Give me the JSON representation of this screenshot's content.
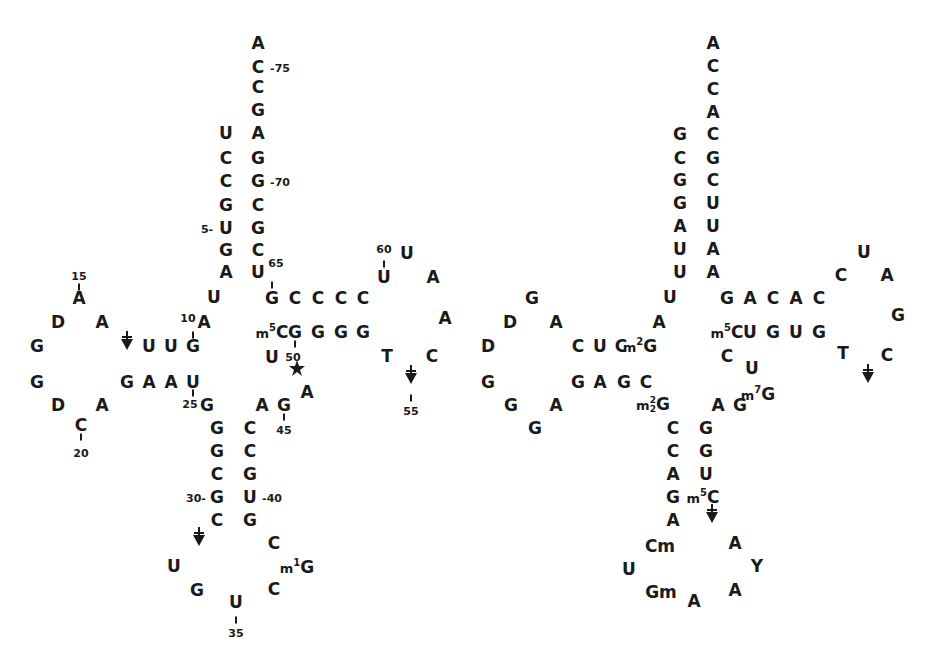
{
  "diagram": {
    "type": "tRNA cloverleaf secondary structures",
    "structures": [
      {
        "id": "left",
        "nucleotides": [
          {
            "t": "A",
            "x": 258,
            "y": 43
          },
          {
            "t": "C",
            "x": 258,
            "y": 67
          },
          {
            "t": "C",
            "x": 258,
            "y": 87
          },
          {
            "t": "G",
            "x": 258,
            "y": 110
          },
          {
            "t": "A",
            "x": 258,
            "y": 133
          },
          {
            "t": "G",
            "x": 258,
            "y": 158
          },
          {
            "t": "G",
            "x": 258,
            "y": 181
          },
          {
            "t": "C",
            "x": 258,
            "y": 205
          },
          {
            "t": "G",
            "x": 258,
            "y": 228
          },
          {
            "t": "C",
            "x": 258,
            "y": 250
          },
          {
            "t": "U",
            "x": 258,
            "y": 272
          },
          {
            "t": "U",
            "x": 226,
            "y": 133
          },
          {
            "t": "C",
            "x": 226,
            "y": 158
          },
          {
            "t": "C",
            "x": 226,
            "y": 181
          },
          {
            "t": "G",
            "x": 226,
            "y": 205
          },
          {
            "t": "U",
            "x": 226,
            "y": 228
          },
          {
            "t": "G",
            "x": 226,
            "y": 250
          },
          {
            "t": "A",
            "x": 226,
            "y": 272
          },
          {
            "t": "U",
            "x": 214,
            "y": 297
          },
          {
            "t": "A",
            "x": 204,
            "y": 322
          },
          {
            "t": "G",
            "x": 193,
            "y": 346
          },
          {
            "t": "U",
            "x": 171,
            "y": 346
          },
          {
            "t": "U",
            "x": 149,
            "y": 346
          },
          {
            "t": "A",
            "x": 79,
            "y": 298
          },
          {
            "t": "D",
            "x": 58,
            "y": 322
          },
          {
            "t": "A",
            "x": 102,
            "y": 322
          },
          {
            "t": "G",
            "x": 37,
            "y": 346
          },
          {
            "t": "G",
            "x": 37,
            "y": 382
          },
          {
            "t": "D",
            "x": 58,
            "y": 405
          },
          {
            "t": "A",
            "x": 102,
            "y": 405
          },
          {
            "t": "C",
            "x": 81,
            "y": 425
          },
          {
            "t": "G",
            "x": 127,
            "y": 382
          },
          {
            "t": "A",
            "x": 149,
            "y": 382
          },
          {
            "t": "A",
            "x": 171,
            "y": 382
          },
          {
            "t": "U",
            "x": 193,
            "y": 382
          },
          {
            "t": "G",
            "x": 207,
            "y": 405
          },
          {
            "t": "G",
            "x": 217,
            "y": 428
          },
          {
            "t": "G",
            "x": 217,
            "y": 451
          },
          {
            "t": "C",
            "x": 217,
            "y": 474
          },
          {
            "t": "G",
            "x": 217,
            "y": 497
          },
          {
            "t": "C",
            "x": 217,
            "y": 520
          },
          {
            "t": "C",
            "x": 250,
            "y": 428
          },
          {
            "t": "C",
            "x": 250,
            "y": 451
          },
          {
            "t": "G",
            "x": 250,
            "y": 474
          },
          {
            "t": "U",
            "x": 250,
            "y": 497
          },
          {
            "t": "G",
            "x": 250,
            "y": 520
          },
          {
            "t": "U",
            "x": 174,
            "y": 566
          },
          {
            "t": "G",
            "x": 197,
            "y": 590
          },
          {
            "t": "U",
            "x": 236,
            "y": 602
          },
          {
            "t": "C",
            "x": 274,
            "y": 589
          },
          {
            "t": "G",
            "x": 297,
            "y": 567,
            "pre": "m",
            "sup": "1"
          },
          {
            "t": "C",
            "x": 274,
            "y": 543
          },
          {
            "t": "A",
            "x": 262,
            "y": 405
          },
          {
            "t": "G",
            "x": 284,
            "y": 405
          },
          {
            "t": "A",
            "x": 307,
            "y": 392
          },
          {
            "t": "U",
            "x": 272,
            "y": 357
          },
          {
            "t": "C",
            "x": 272,
            "y": 332,
            "pre": "m",
            "sup": "5"
          },
          {
            "t": "G",
            "x": 295,
            "y": 332
          },
          {
            "t": "G",
            "x": 318,
            "y": 332
          },
          {
            "t": "G",
            "x": 341,
            "y": 332
          },
          {
            "t": "G",
            "x": 363,
            "y": 332
          },
          {
            "t": "G",
            "x": 272,
            "y": 298
          },
          {
            "t": "C",
            "x": 295,
            "y": 298
          },
          {
            "t": "C",
            "x": 318,
            "y": 298
          },
          {
            "t": "C",
            "x": 341,
            "y": 298
          },
          {
            "t": "C",
            "x": 363,
            "y": 298
          },
          {
            "t": "U",
            "x": 384,
            "y": 277
          },
          {
            "t": "U",
            "x": 407,
            "y": 253
          },
          {
            "t": "A",
            "x": 433,
            "y": 277
          },
          {
            "t": "A",
            "x": 445,
            "y": 318
          },
          {
            "t": "C",
            "x": 432,
            "y": 356
          },
          {
            "t": "T",
            "x": 387,
            "y": 356
          }
        ],
        "labels": [
          {
            "t": "-75",
            "x": 280,
            "y": 68
          },
          {
            "t": "-70",
            "x": 280,
            "y": 182
          },
          {
            "t": "5-",
            "x": 207,
            "y": 229
          },
          {
            "t": "65",
            "x": 276,
            "y": 263
          },
          {
            "t": "15",
            "x": 79,
            "y": 276
          },
          {
            "t": "10",
            "x": 188,
            "y": 318
          },
          {
            "t": "25",
            "x": 190,
            "y": 404
          },
          {
            "t": "20",
            "x": 81,
            "y": 453
          },
          {
            "t": "30-",
            "x": 196,
            "y": 498
          },
          {
            "t": "-40",
            "x": 272,
            "y": 498
          },
          {
            "t": "45",
            "x": 284,
            "y": 430
          },
          {
            "t": "35",
            "x": 236,
            "y": 633
          },
          {
            "t": "50",
            "x": 293,
            "y": 357
          },
          {
            "t": "60",
            "x": 384,
            "y": 249
          },
          {
            "t": "55",
            "x": 411,
            "y": 411
          }
        ],
        "ticks": [
          {
            "x": 79,
            "y": 287
          },
          {
            "x": 193,
            "y": 335
          },
          {
            "x": 193,
            "y": 393
          },
          {
            "x": 81,
            "y": 437
          },
          {
            "x": 272,
            "y": 285
          },
          {
            "x": 284,
            "y": 417
          },
          {
            "x": 236,
            "y": 620
          },
          {
            "x": 295,
            "y": 344
          },
          {
            "x": 384,
            "y": 264
          },
          {
            "x": 411,
            "y": 398
          }
        ],
        "arrows": [
          {
            "x": 127,
            "y": 343
          },
          {
            "x": 411,
            "y": 377
          },
          {
            "x": 199,
            "y": 539
          }
        ],
        "stars": [
          {
            "x": 297,
            "y": 370
          }
        ]
      },
      {
        "id": "right",
        "nucleotides": [
          {
            "t": "A",
            "x": 713,
            "y": 43
          },
          {
            "t": "C",
            "x": 713,
            "y": 66
          },
          {
            "t": "C",
            "x": 713,
            "y": 89
          },
          {
            "t": "A",
            "x": 713,
            "y": 112
          },
          {
            "t": "C",
            "x": 713,
            "y": 134
          },
          {
            "t": "G",
            "x": 713,
            "y": 158
          },
          {
            "t": "C",
            "x": 713,
            "y": 180
          },
          {
            "t": "U",
            "x": 713,
            "y": 203
          },
          {
            "t": "U",
            "x": 713,
            "y": 226
          },
          {
            "t": "A",
            "x": 713,
            "y": 249
          },
          {
            "t": "A",
            "x": 713,
            "y": 272
          },
          {
            "t": "G",
            "x": 680,
            "y": 134
          },
          {
            "t": "C",
            "x": 680,
            "y": 158
          },
          {
            "t": "G",
            "x": 680,
            "y": 180
          },
          {
            "t": "G",
            "x": 680,
            "y": 203
          },
          {
            "t": "A",
            "x": 680,
            "y": 226
          },
          {
            "t": "U",
            "x": 680,
            "y": 249
          },
          {
            "t": "U",
            "x": 680,
            "y": 272
          },
          {
            "t": "U",
            "x": 670,
            "y": 297
          },
          {
            "t": "A",
            "x": 659,
            "y": 322
          },
          {
            "t": "G",
            "x": 640,
            "y": 346,
            "pre": "m",
            "sup": "2"
          },
          {
            "t": "C",
            "x": 621,
            "y": 346
          },
          {
            "t": "U",
            "x": 600,
            "y": 346
          },
          {
            "t": "C",
            "x": 578,
            "y": 346
          },
          {
            "t": "G",
            "x": 532,
            "y": 298
          },
          {
            "t": "D",
            "x": 510,
            "y": 322
          },
          {
            "t": "A",
            "x": 556,
            "y": 322
          },
          {
            "t": "D",
            "x": 488,
            "y": 346
          },
          {
            "t": "G",
            "x": 488,
            "y": 382
          },
          {
            "t": "G",
            "x": 511,
            "y": 405
          },
          {
            "t": "A",
            "x": 556,
            "y": 405
          },
          {
            "t": "G",
            "x": 535,
            "y": 428
          },
          {
            "t": "G",
            "x": 578,
            "y": 382
          },
          {
            "t": "A",
            "x": 600,
            "y": 382
          },
          {
            "t": "G",
            "x": 624,
            "y": 382
          },
          {
            "t": "C",
            "x": 646,
            "y": 382
          },
          {
            "t": "G",
            "x": 653,
            "y": 405,
            "pre": "m",
            "sup": "2",
            "sub": "2"
          },
          {
            "t": "C",
            "x": 673,
            "y": 428
          },
          {
            "t": "C",
            "x": 673,
            "y": 451
          },
          {
            "t": "A",
            "x": 673,
            "y": 474
          },
          {
            "t": "G",
            "x": 673,
            "y": 497
          },
          {
            "t": "A",
            "x": 673,
            "y": 520
          },
          {
            "t": "G",
            "x": 706,
            "y": 428
          },
          {
            "t": "G",
            "x": 706,
            "y": 451
          },
          {
            "t": "U",
            "x": 706,
            "y": 474
          },
          {
            "t": "C",
            "x": 703,
            "y": 497,
            "pre": "m",
            "sup": "5"
          },
          {
            "t": "Cm",
            "x": 660,
            "y": 546
          },
          {
            "t": "U",
            "x": 629,
            "y": 569
          },
          {
            "t": "Gm",
            "x": 661,
            "y": 592
          },
          {
            "t": "A",
            "x": 694,
            "y": 601
          },
          {
            "t": "A",
            "x": 735,
            "y": 590
          },
          {
            "t": "Y",
            "x": 757,
            "y": 566
          },
          {
            "t": "A",
            "x": 735,
            "y": 543
          },
          {
            "t": "A",
            "x": 718,
            "y": 405
          },
          {
            "t": "G",
            "x": 740,
            "y": 405
          },
          {
            "t": "G",
            "x": 758,
            "y": 394,
            "pre": "m",
            "sup": "7"
          },
          {
            "t": "U",
            "x": 752,
            "y": 368
          },
          {
            "t": "C",
            "x": 727,
            "y": 356
          },
          {
            "t": "C",
            "x": 727,
            "y": 332,
            "pre": "m",
            "sup": "5"
          },
          {
            "t": "U",
            "x": 750,
            "y": 332
          },
          {
            "t": "G",
            "x": 773,
            "y": 332
          },
          {
            "t": "U",
            "x": 796,
            "y": 332
          },
          {
            "t": "G",
            "x": 819,
            "y": 332
          },
          {
            "t": "G",
            "x": 727,
            "y": 298
          },
          {
            "t": "A",
            "x": 750,
            "y": 298
          },
          {
            "t": "C",
            "x": 773,
            "y": 298
          },
          {
            "t": "A",
            "x": 796,
            "y": 298
          },
          {
            "t": "C",
            "x": 819,
            "y": 298
          },
          {
            "t": "C",
            "x": 841,
            "y": 275
          },
          {
            "t": "U",
            "x": 864,
            "y": 252
          },
          {
            "t": "A",
            "x": 887,
            "y": 275
          },
          {
            "t": "G",
            "x": 898,
            "y": 315
          },
          {
            "t": "C",
            "x": 887,
            "y": 355
          },
          {
            "t": "T",
            "x": 843,
            "y": 353
          }
        ],
        "labels": [],
        "ticks": [],
        "arrows": [
          {
            "x": 868,
            "y": 376
          },
          {
            "x": 712,
            "y": 516
          }
        ],
        "stars": []
      }
    ]
  }
}
